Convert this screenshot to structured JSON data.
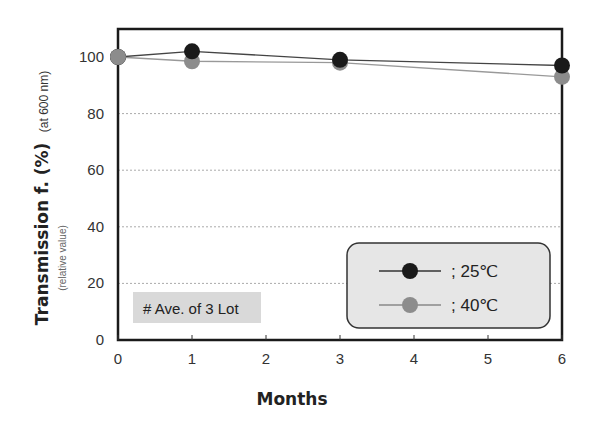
{
  "chart_data": {
    "type": "line",
    "title": "",
    "xlabel": "Months",
    "ylabel": "Transmission f. (%)",
    "ylabel_suffix": "(at 600 nm)",
    "ylabel_sub": "(relative value)",
    "x": [
      0,
      1,
      3,
      6
    ],
    "xlim": [
      0,
      6
    ],
    "ylim": [
      0,
      100
    ],
    "xticks": [
      "0",
      "1",
      "2",
      "3",
      "4",
      "5",
      "6"
    ],
    "yticks": [
      "0",
      "20",
      "40",
      "60",
      "80",
      "100"
    ],
    "grid": {
      "horizontal": true,
      "style": "dotted",
      "values": [
        20,
        40,
        60,
        80
      ]
    },
    "series": [
      {
        "name": "; 25℃",
        "values": [
          100,
          102,
          99,
          97
        ],
        "color": "#1a1a1a"
      },
      {
        "name": "; 40℃",
        "values": [
          100,
          98.5,
          98,
          93
        ],
        "color": "#8c8c8c"
      }
    ],
    "legend_position": "lower right",
    "annotations": [
      "# Ave. of 3 Lot"
    ]
  },
  "legend": {
    "items": [
      {
        "label": "; 25℃",
        "color": "#1a1a1a"
      },
      {
        "label": "; 40℃",
        "color": "#8c8c8c"
      }
    ],
    "background": "#e6e6e6"
  },
  "note": {
    "text": "# Ave. of 3 Lot",
    "background": "#d9d9d9"
  }
}
